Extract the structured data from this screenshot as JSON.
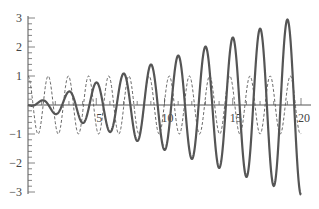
{
  "chart_data": {
    "type": "line",
    "title": "",
    "xlabel": "",
    "ylabel": "",
    "xlim": [
      0,
      20
    ],
    "ylim": [
      -3,
      3
    ],
    "grid": false,
    "legend": null,
    "x_ticks": [
      5,
      10,
      15,
      20
    ],
    "x_tick_labels": [
      "5",
      "10",
      "15",
      "20"
    ],
    "y_ticks": [
      -3,
      -2,
      -1,
      1,
      2,
      3
    ],
    "y_tick_labels": [
      "−3",
      "−2",
      "−1",
      "1",
      "2",
      "3"
    ],
    "series": [
      {
        "name": "response (growing oscillation)",
        "style": "solid",
        "color": "#555555",
        "description": "Oscillation with linearly growing amplitude, approx 0.15*x*sin(pi*x), reaching about ±3 at x=20",
        "x": [
          0,
          1,
          2,
          3,
          4,
          5,
          6,
          7,
          8,
          9,
          10,
          11,
          12,
          13,
          14,
          15,
          16,
          17,
          18,
          19,
          20
        ],
        "peaks_approx": [
          0.05,
          0.3,
          0.6,
          0.9,
          1.2,
          1.5,
          1.8,
          2.1,
          2.45,
          2.75,
          3.05
        ]
      },
      {
        "name": "forcing (unit cosine)",
        "style": "dashed",
        "color": "#555555",
        "description": "Constant-amplitude oscillation between -1 and 1",
        "amplitude": 1
      }
    ]
  }
}
